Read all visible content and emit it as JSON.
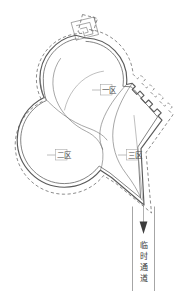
{
  "diagram": {
    "background_color": "#ffffff",
    "line_color": "#5a5a5a",
    "dash_color": "#6e6e6e",
    "text_color": "#4a4a4a",
    "zones": [
      {
        "id": "zone-1",
        "label": "一区",
        "x": 106,
        "y": 91
      },
      {
        "id": "zone-2",
        "label": "二区",
        "x": 57,
        "y": 156
      },
      {
        "id": "zone-3",
        "label": "三区",
        "x": 128,
        "y": 156
      }
    ],
    "corridor": {
      "id": "temporary-passage",
      "label": "临时通道",
      "label_chars": [
        "临",
        "时",
        "通",
        "道"
      ],
      "direction": "down",
      "arrow": "▼"
    },
    "entrance": {
      "id": "top-entrance-structure",
      "shape": "spiral-rectangle"
    }
  }
}
